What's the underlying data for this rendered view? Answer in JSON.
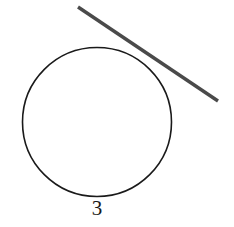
{
  "figure": {
    "background_color": "#ffffff",
    "width": 234,
    "height": 227,
    "label": "3",
    "label_color": "#1a1a1a",
    "circle": {
      "name": "circle",
      "center_x": 97,
      "center_y": 122,
      "radius": 74.5,
      "stroke_color": "#1a1a1a",
      "stroke_width": 1.6,
      "fill": "none"
    },
    "line": {
      "name": "line-segment",
      "x1": 78,
      "y1": 7,
      "x2": 218,
      "y2": 101,
      "stroke_color": "#4a4a4a",
      "stroke_width": 3.4,
      "linecap": "butt"
    }
  }
}
